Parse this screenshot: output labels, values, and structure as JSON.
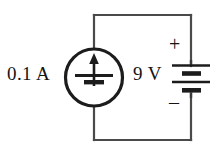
{
  "figure": {
    "background_color": "#ffffff",
    "line_color": "#4a4a4a",
    "ink_color": "#1c1c1c"
  },
  "labels": {
    "current": "0.1 A",
    "voltage": "9 V",
    "positive_terminal": "+",
    "negative_terminal": "–"
  },
  "components": [
    {
      "name": "current-source",
      "symbol": "circle-with-up-arrow",
      "value": "0.1 A",
      "position": "left branch"
    },
    {
      "name": "battery",
      "symbol": "multi-cell-battery",
      "value": "9 V",
      "position": "right branch",
      "plates": 4,
      "polarity_top": "+",
      "polarity_bottom": "–"
    }
  ],
  "geometry": {
    "loop": {
      "left_x": 94,
      "right_x": 191,
      "top_y": 15,
      "bottom_y": 140
    },
    "source_circle": {
      "cx": 94,
      "cy": 77,
      "r": 29
    },
    "battery_plates_y": [
      65,
      73,
      82,
      91
    ]
  }
}
